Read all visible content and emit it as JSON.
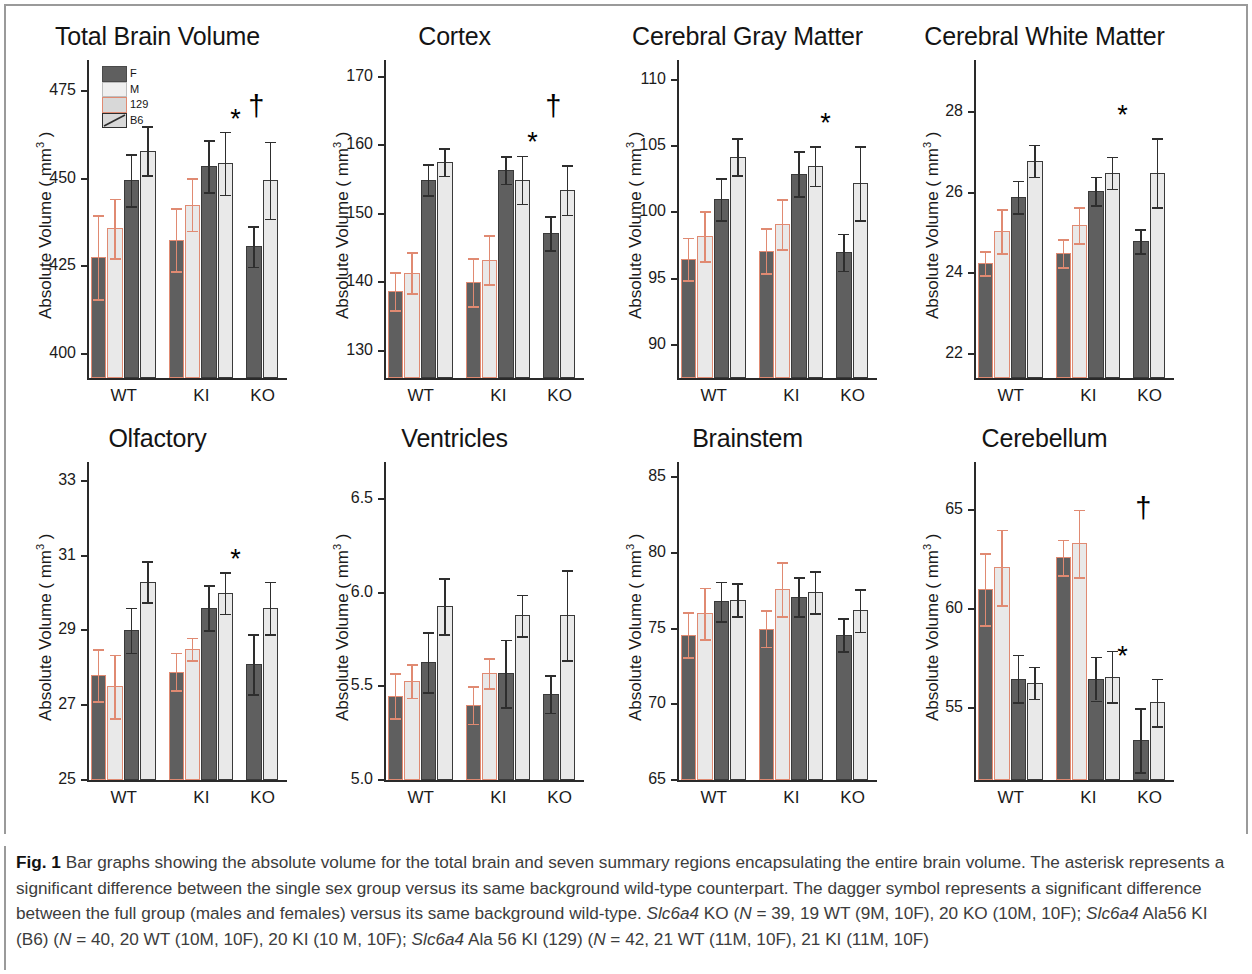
{
  "figure": {
    "label": "Fig. 1",
    "caption_text": " Bar graphs showing the absolute volume for the total brain and seven summary regions encapsulating the entire brain volume. The asterisk represents a significant difference between the single sex group versus its same background wild-type counterpart. The dagger symbol represents a significant difference between the full group (males and females) versus its same background wild-type. ",
    "caption_part2": " KO (",
    "caption_n1": "N",
    "caption_part3": " = 39, 19 WT (9M, 10F), 20 KO (10M, 10F); ",
    "caption_part4": " Ala56 KI (B6) (",
    "caption_n2": "N",
    "caption_part5": " = 40, 20 WT (10M, 10F), 20 KI (10 M, 10F); ",
    "caption_part6": " Ala 56 KI (129) (",
    "caption_n3": "N",
    "caption_part7": " = 42, 21 WT (11M, 10F), 21 KI (11M, 10F)",
    "gene_italic": "Slc6a4"
  },
  "legend": {
    "items": [
      {
        "key": "F",
        "label": "F",
        "swatch": "dark-gray-fill"
      },
      {
        "key": "M",
        "label": "M",
        "swatch": "light-gray-fill"
      },
      {
        "key": "129",
        "label": "129",
        "swatch": "orange-outline"
      },
      {
        "key": "B6",
        "label": "B6",
        "swatch": "black-outline-hatch"
      }
    ]
  },
  "colors": {
    "female_fill": "#5f5f5f",
    "male_fill": "#e9e9e9",
    "background_129_outline": "#e08a72",
    "background_B6_outline": "#3a3a3a",
    "axis": "#2a2a2a",
    "text": "#1b1b1b"
  },
  "shared": {
    "ylabel": "Absolute Volume ( mm",
    "ylabel_sup": "3",
    "ylabel_close": " )",
    "categories": [
      "WT",
      "KI",
      "KO"
    ],
    "bar_series": [
      {
        "sex": "F",
        "background": "129"
      },
      {
        "sex": "M",
        "background": "129"
      },
      {
        "sex": "F",
        "background": "B6"
      },
      {
        "sex": "M",
        "background": "B6"
      }
    ],
    "ko_series": [
      {
        "sex": "F",
        "background": "B6"
      },
      {
        "sex": "M",
        "background": "B6"
      }
    ]
  },
  "chart_data": [
    {
      "type": "bar",
      "title": "Total Brain Volume",
      "xlabel": "",
      "ylabel": "Absolute Volume ( mm3 )",
      "ylim": [
        393,
        484
      ],
      "yticks": [
        400,
        425,
        450,
        475
      ],
      "ytick_labels": [
        "400",
        "425",
        "450",
        "475"
      ],
      "categories": [
        "WT",
        "KI",
        "KO"
      ],
      "grid": false,
      "series": [
        {
          "name": "F 129",
          "values": [
            427.6,
            432.6,
            null
          ]
        },
        {
          "name": "M 129",
          "values": [
            435.8,
            442.6,
            null
          ]
        },
        {
          "name": "F B6",
          "values": [
            449.6,
            453.6,
            430.7
          ]
        },
        {
          "name": "M B6",
          "values": [
            458.0,
            454.5,
            449.6
          ]
        }
      ],
      "errors": [
        {
          "name": "F 129",
          "values": [
            12.0,
            9.0,
            null
          ]
        },
        {
          "name": "M 129",
          "values": [
            8.5,
            7.5,
            null
          ]
        },
        {
          "name": "F B6",
          "values": [
            7.5,
            7.5,
            5.8
          ]
        },
        {
          "name": "M B6",
          "values": [
            7.0,
            9.0,
            11.0
          ]
        }
      ],
      "annotations": [
        {
          "symbol": "*",
          "group": "KO",
          "meaning": "single-sex-significant"
        },
        {
          "symbol": "†",
          "group": "KO",
          "meaning": "full-group-significant"
        }
      ]
    },
    {
      "type": "bar",
      "title": "Cortex",
      "xlabel": "",
      "ylabel": "Absolute Volume ( mm3 )",
      "ylim": [
        126,
        172.5
      ],
      "yticks": [
        130,
        140,
        150,
        160,
        170
      ],
      "ytick_labels": [
        "130",
        "140",
        "150",
        "160",
        "170"
      ],
      "categories": [
        "WT",
        "KI",
        "KO"
      ],
      "grid": false,
      "series": [
        {
          "name": "F 129",
          "values": [
            138.7,
            140.0,
            null
          ]
        },
        {
          "name": "M 129",
          "values": [
            141.4,
            143.3,
            null
          ]
        },
        {
          "name": "F B6",
          "values": [
            155.0,
            156.4,
            147.2
          ]
        },
        {
          "name": "M B6",
          "values": [
            157.6,
            155.0,
            153.5
          ]
        }
      ],
      "errors": [
        {
          "name": "F 129",
          "values": [
            2.8,
            3.5,
            null
          ]
        },
        {
          "name": "M 129",
          "values": [
            3.0,
            3.6,
            null
          ]
        },
        {
          "name": "F B6",
          "values": [
            2.3,
            2.0,
            2.5
          ]
        },
        {
          "name": "M B6",
          "values": [
            2.0,
            3.5,
            3.6
          ]
        }
      ],
      "annotations": [
        {
          "symbol": "*",
          "group": "KO",
          "meaning": "single-sex-significant"
        },
        {
          "symbol": "†",
          "group": "KO",
          "meaning": "full-group-significant"
        }
      ]
    },
    {
      "type": "bar",
      "title": "Cerebral Gray Matter",
      "xlabel": "",
      "ylabel": "Absolute Volume ( mm3 )",
      "ylim": [
        87.5,
        111.5
      ],
      "yticks": [
        90,
        95,
        100,
        105,
        110
      ],
      "ytick_labels": [
        "90",
        "95",
        "100",
        "105",
        "110"
      ],
      "categories": [
        "WT",
        "KI",
        "KO"
      ],
      "grid": false,
      "series": [
        {
          "name": "F 129",
          "values": [
            96.5,
            97.1,
            null
          ]
        },
        {
          "name": "M 129",
          "values": [
            98.2,
            99.1,
            null
          ]
        },
        {
          "name": "F B6",
          "values": [
            101.0,
            102.9,
            97.0
          ]
        },
        {
          "name": "M B6",
          "values": [
            104.2,
            103.5,
            102.2
          ]
        }
      ],
      "errors": [
        {
          "name": "F 129",
          "values": [
            1.6,
            1.7,
            null
          ]
        },
        {
          "name": "M 129",
          "values": [
            1.9,
            1.9,
            null
          ]
        },
        {
          "name": "F B6",
          "values": [
            1.6,
            1.7,
            1.4
          ]
        },
        {
          "name": "M B6",
          "values": [
            1.4,
            1.5,
            2.8
          ]
        }
      ],
      "annotations": [
        {
          "symbol": "*",
          "group": "KO",
          "meaning": "single-sex-significant"
        }
      ]
    },
    {
      "type": "bar",
      "title": "Cerebral White Matter",
      "xlabel": "",
      "ylabel": "Absolute Volume ( mm3 )",
      "ylim": [
        21.4,
        29.3
      ],
      "yticks": [
        22,
        24,
        26,
        28
      ],
      "ytick_labels": [
        "22",
        "24",
        "26",
        "28"
      ],
      "categories": [
        "WT",
        "KI",
        "KO"
      ],
      "grid": false,
      "series": [
        {
          "name": "F 129",
          "values": [
            24.25,
            24.5,
            null
          ]
        },
        {
          "name": "M 129",
          "values": [
            25.05,
            25.2,
            null
          ]
        },
        {
          "name": "F B6",
          "values": [
            25.9,
            26.05,
            24.8
          ]
        },
        {
          "name": "M B6",
          "values": [
            26.8,
            26.5,
            26.5
          ]
        }
      ],
      "errors": [
        {
          "name": "F 129",
          "values": [
            0.3,
            0.35,
            null
          ]
        },
        {
          "name": "M 129",
          "values": [
            0.55,
            0.45,
            null
          ]
        },
        {
          "name": "F B6",
          "values": [
            0.4,
            0.35,
            0.3
          ]
        },
        {
          "name": "M B6",
          "values": [
            0.4,
            0.4,
            0.85
          ]
        }
      ],
      "annotations": [
        {
          "symbol": "*",
          "group": "KO",
          "meaning": "single-sex-significant"
        }
      ]
    },
    {
      "type": "bar",
      "title": "Olfactory",
      "xlabel": "",
      "ylabel": "Absolute Volume ( mm3 )",
      "ylim": [
        25,
        33.5
      ],
      "yticks": [
        25,
        27,
        29,
        31,
        33
      ],
      "ytick_labels": [
        "25",
        "27",
        "29",
        "31",
        "33"
      ],
      "categories": [
        "WT",
        "KI",
        "KO"
      ],
      "grid": false,
      "series": [
        {
          "name": "F 129",
          "values": [
            27.8,
            27.9,
            null
          ]
        },
        {
          "name": "M 129",
          "values": [
            27.5,
            28.5,
            null
          ]
        },
        {
          "name": "F B6",
          "values": [
            29.0,
            29.6,
            28.1
          ]
        },
        {
          "name": "M B6",
          "values": [
            30.3,
            30.0,
            29.6
          ]
        }
      ],
      "errors": [
        {
          "name": "F 129",
          "values": [
            0.7,
            0.5,
            null
          ]
        },
        {
          "name": "M 129",
          "values": [
            0.85,
            0.3,
            null
          ]
        },
        {
          "name": "F B6",
          "values": [
            0.6,
            0.6,
            0.8
          ]
        },
        {
          "name": "M B6",
          "values": [
            0.55,
            0.55,
            0.7
          ]
        }
      ],
      "annotations": [
        {
          "symbol": "*",
          "group": "KO",
          "meaning": "single-sex-significant"
        }
      ]
    },
    {
      "type": "bar",
      "title": "Ventricles",
      "xlabel": "",
      "ylabel": "Absolute Volume ( mm3 )",
      "ylim": [
        5.0,
        6.7
      ],
      "yticks": [
        5.0,
        5.5,
        6.0,
        6.5
      ],
      "ytick_labels": [
        "5.0",
        "5.5",
        "6.0",
        "6.5"
      ],
      "categories": [
        "WT",
        "KI",
        "KO"
      ],
      "grid": false,
      "series": [
        {
          "name": "F 129",
          "values": [
            5.45,
            5.4,
            null
          ]
        },
        {
          "name": "M 129",
          "values": [
            5.53,
            5.57,
            null
          ]
        },
        {
          "name": "F B6",
          "values": [
            5.63,
            5.57,
            5.46
          ]
        },
        {
          "name": "M B6",
          "values": [
            5.93,
            5.88,
            5.88
          ]
        }
      ],
      "errors": [
        {
          "name": "F 129",
          "values": [
            0.12,
            0.1,
            null
          ]
        },
        {
          "name": "M 129",
          "values": [
            0.09,
            0.08,
            null
          ]
        },
        {
          "name": "F B6",
          "values": [
            0.16,
            0.18,
            0.1
          ]
        },
        {
          "name": "M B6",
          "values": [
            0.15,
            0.11,
            0.24
          ]
        }
      ],
      "annotations": []
    },
    {
      "type": "bar",
      "title": "Brainstem",
      "xlabel": "",
      "ylabel": "Absolute Volume ( mm3 )",
      "ylim": [
        65,
        86
      ],
      "yticks": [
        65,
        70,
        75,
        80,
        85
      ],
      "ytick_labels": [
        "65",
        "70",
        "75",
        "80",
        "85"
      ],
      "categories": [
        "WT",
        "KI",
        "KO"
      ],
      "grid": false,
      "series": [
        {
          "name": "F 129",
          "values": [
            74.6,
            75.0,
            null
          ]
        },
        {
          "name": "M 129",
          "values": [
            76.0,
            77.6,
            null
          ]
        },
        {
          "name": "F B6",
          "values": [
            76.8,
            77.1,
            74.6
          ]
        },
        {
          "name": "M B6",
          "values": [
            76.9,
            77.4,
            76.2
          ]
        }
      ],
      "errors": [
        {
          "name": "F 129",
          "values": [
            1.5,
            1.2,
            null
          ]
        },
        {
          "name": "M 129",
          "values": [
            1.7,
            1.8,
            null
          ]
        },
        {
          "name": "F B6",
          "values": [
            1.3,
            1.3,
            1.1
          ]
        },
        {
          "name": "M B6",
          "values": [
            1.1,
            1.4,
            1.4
          ]
        }
      ],
      "annotations": []
    },
    {
      "type": "bar",
      "title": "Cerebellum",
      "xlabel": "",
      "ylabel": "Absolute Volume ( mm3 )",
      "ylim": [
        51.4,
        67.4
      ],
      "yticks": [
        55,
        60,
        65
      ],
      "ytick_labels": [
        "55",
        "60",
        "65"
      ],
      "categories": [
        "WT",
        "KI",
        "KO"
      ],
      "grid": false,
      "series": [
        {
          "name": "F 129",
          "values": [
            61.0,
            62.6,
            null
          ]
        },
        {
          "name": "M 129",
          "values": [
            62.1,
            63.3,
            null
          ]
        },
        {
          "name": "F B6",
          "values": [
            56.5,
            56.5,
            53.4
          ]
        },
        {
          "name": "M B6",
          "values": [
            56.3,
            56.6,
            55.3
          ]
        }
      ],
      "errors": [
        {
          "name": "F 129",
          "values": [
            1.8,
            0.9,
            null
          ]
        },
        {
          "name": "M 129",
          "values": [
            1.9,
            1.7,
            null
          ]
        },
        {
          "name": "F B6",
          "values": [
            1.2,
            1.1,
            1.6
          ]
        },
        {
          "name": "M B6",
          "values": [
            0.8,
            1.3,
            1.2
          ]
        }
      ],
      "annotations": [
        {
          "symbol": "*",
          "group": "KO",
          "meaning": "single-sex-significant"
        },
        {
          "symbol": "†",
          "group": "KO",
          "meaning": "full-group-significant"
        }
      ]
    }
  ]
}
